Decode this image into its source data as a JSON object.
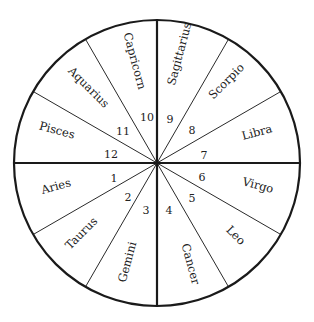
{
  "diagram": {
    "type": "astrological-house-wheel",
    "center": [
      157,
      163
    ],
    "radius": 143,
    "colors": {
      "line": "#1a1a1a",
      "text": "#222222",
      "background": "#ffffff"
    },
    "houses": [
      {
        "number": "1",
        "sign": "Aries",
        "mid_angle": 195
      },
      {
        "number": "2",
        "sign": "Taurus",
        "mid_angle": 225
      },
      {
        "number": "3",
        "sign": "Gemini",
        "mid_angle": 255
      },
      {
        "number": "4",
        "sign": "Cancer",
        "mid_angle": 285
      },
      {
        "number": "5",
        "sign": "Leo",
        "mid_angle": 315
      },
      {
        "number": "6",
        "sign": "Virgo",
        "mid_angle": 345
      },
      {
        "number": "7",
        "sign": "Libra",
        "mid_angle": 15
      },
      {
        "number": "8",
        "sign": "Scorpio",
        "mid_angle": 45
      },
      {
        "number": "9",
        "sign": "Sagittarius",
        "mid_angle": 75
      },
      {
        "number": "10",
        "sign": "Capricorn",
        "mid_angle": 105
      },
      {
        "number": "11",
        "sign": "Aquarius",
        "mid_angle": 135
      },
      {
        "number": "12",
        "sign": "Pisces",
        "mid_angle": 165
      }
    ]
  }
}
